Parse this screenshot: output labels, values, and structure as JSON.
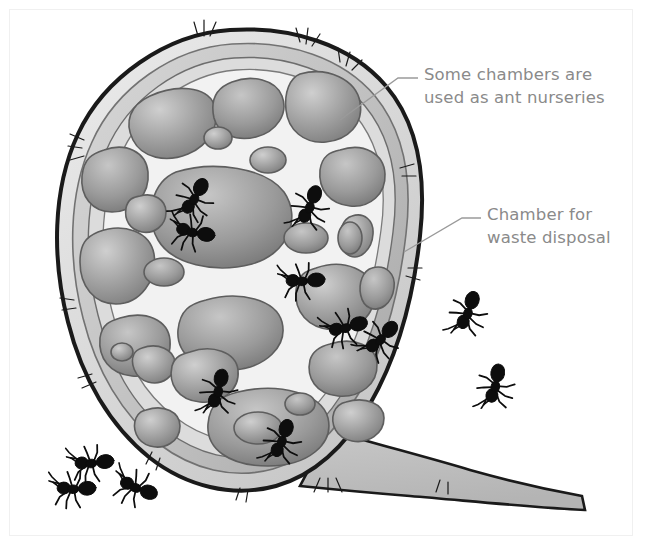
{
  "figure": {
    "type": "illustration",
    "background_color": "#ffffff",
    "frame_color": "#f0f0f0"
  },
  "callouts": [
    {
      "id": "nursery",
      "line1": "Some chambers are",
      "line2": "used as ant nurseries",
      "text_color": "#8a8a8a",
      "leader_from": [
        340,
        120
      ],
      "leader_to": [
        416,
        78
      ]
    },
    {
      "id": "waste",
      "line1": "Chamber for",
      "line2": "waste disposal",
      "text_color": "#8a8a8a",
      "leader_from": [
        404,
        252
      ],
      "leader_to": [
        479,
        218
      ]
    }
  ],
  "nest": {
    "outline_color": "#1a1a1a",
    "body_light": "#e9e9e9",
    "body_mid": "#c4c4c4",
    "chamber_dark": "#8f8f8f",
    "tunnel_color": "#f6f6f6",
    "ground_color": "#bdbdbd"
  },
  "ants": {
    "color": "#0d0d0d",
    "inside_count": 8,
    "outside_left_count": 3,
    "outside_right_count": 2,
    "inside_positions": [
      [
        196,
        196
      ],
      [
        196,
        233
      ],
      [
        311,
        204
      ],
      [
        306,
        281
      ],
      [
        349,
        327
      ],
      [
        383,
        337
      ],
      [
        219,
        388
      ],
      [
        283,
        438
      ]
    ],
    "outside_left_positions": [
      [
        95,
        463
      ],
      [
        77,
        489
      ],
      [
        139,
        489
      ]
    ],
    "outside_right_positions": [
      [
        469,
        310
      ],
      [
        496,
        383
      ]
    ]
  }
}
